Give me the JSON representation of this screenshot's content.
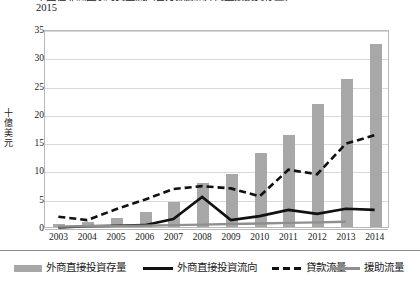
{
  "title": {
    "bullet": "•",
    "line1": "中國在非洲國家的資金流入官方數據和外商直接投資存量，2003–",
    "line2": "2015"
  },
  "chart_data": {
    "type": "bar",
    "xlabel": "",
    "ylabel": "十億美元",
    "ylim": [
      0,
      35
    ],
    "yticks": [
      0,
      5,
      10,
      15,
      20,
      25,
      30,
      35
    ],
    "grid": true,
    "legend_position": "bottom",
    "categories": [
      "2003",
      "2004",
      "2005",
      "2006",
      "2007",
      "2008",
      "2009",
      "2010",
      "2011",
      "2012",
      "2013",
      "2014"
    ],
    "series": [
      {
        "name": "外商直接投資存量",
        "type": "bar",
        "color": "#a8a8a8",
        "values": [
          0.5,
          0.9,
          1.6,
          2.6,
          4.5,
          7.8,
          9.3,
          13.0,
          16.2,
          21.7,
          26.2,
          32.4
        ]
      },
      {
        "name": "外商直接投資流向",
        "type": "line",
        "color": "#111111",
        "values": [
          0.1,
          0.3,
          0.4,
          0.5,
          1.6,
          5.5,
          1.4,
          2.1,
          3.2,
          2.5,
          3.4,
          3.2
        ]
      },
      {
        "name": "貸款流量",
        "type": "line-dashed",
        "color": "#111111",
        "values": [
          2.0,
          1.4,
          3.3,
          5.0,
          6.9,
          7.4,
          7.0,
          5.6,
          10.3,
          9.5,
          14.9,
          16.4
        ]
      },
      {
        "name": "援助流量",
        "type": "line",
        "color": "#8f8f8f",
        "values": [
          0.25,
          0.3,
          0.35,
          0.4,
          0.5,
          0.6,
          0.7,
          0.8,
          0.9,
          1.0,
          1.1,
          null
        ]
      }
    ]
  },
  "legend": {
    "items": [
      {
        "label": "外商直接投資存量",
        "marker": "bar-swatch"
      },
      {
        "label": "外商直接投資流向",
        "marker": "solid-line"
      },
      {
        "label": "貸款流量",
        "marker": "dashed-line"
      },
      {
        "label": "援助流量",
        "marker": "gray-line"
      }
    ]
  }
}
